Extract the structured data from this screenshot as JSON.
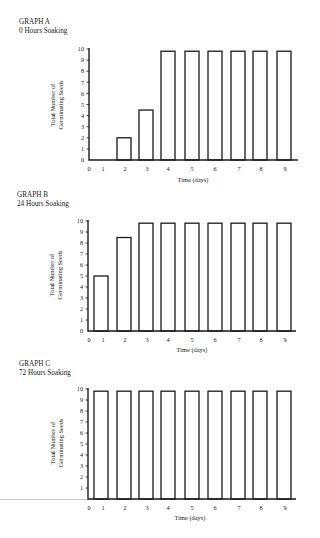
{
  "chart_data": [
    {
      "type": "bar",
      "title": "GRAPH A",
      "subtitle": "0 Hours Soaking",
      "xlabel": "Time (days)",
      "ylabel_lines": [
        "Total Number of",
        "Germinating Seeds"
      ],
      "ylabel": "Total Number of Germinating Seeds",
      "categories": [
        "1",
        "2",
        "3",
        "4",
        "5",
        "6",
        "7",
        "8",
        "9"
      ],
      "values": [
        0,
        2,
        4.5,
        9.8,
        9.8,
        9.8,
        9.8,
        9.8,
        9.8
      ],
      "x_ticks": [
        "0",
        "1",
        "2",
        "3",
        "4",
        "5",
        "6",
        "7",
        "8",
        "9"
      ],
      "y_ticks": [
        "0",
        "1",
        "2",
        "3",
        "4",
        "5",
        "6",
        "7",
        "8",
        "9",
        "10"
      ],
      "ylim": [
        0,
        10
      ],
      "grid": false,
      "legend": null
    },
    {
      "type": "bar",
      "title": "GRAPH B",
      "subtitle": "24 Hours Soaking",
      "xlabel": "Time (days)",
      "ylabel_lines": [
        "Total Number of",
        "Germinating Seeds"
      ],
      "ylabel": "Total Number of Germinating Seeds",
      "categories": [
        "1",
        "2",
        "3",
        "4",
        "5",
        "6",
        "7",
        "8",
        "9"
      ],
      "values": [
        5,
        8.5,
        9.8,
        9.8,
        9.8,
        9.8,
        9.8,
        9.8,
        9.8
      ],
      "x_ticks": [
        "0",
        "1",
        "2",
        "3",
        "4",
        "5",
        "6",
        "7",
        "8",
        "9"
      ],
      "y_ticks": [
        "0",
        "1",
        "2",
        "3",
        "4",
        "5",
        "6",
        "7",
        "8",
        "9",
        "10"
      ],
      "ylim": [
        0,
        10
      ],
      "grid": false,
      "legend": null
    },
    {
      "type": "bar",
      "title": "GRAPH C",
      "subtitle": "72 Hours Soaking",
      "xlabel": "Time (days)",
      "ylabel_lines": [
        "Total Number of",
        "Germinating Seeds"
      ],
      "ylabel": "Total Number of Germinating Seeds",
      "categories": [
        "1",
        "2",
        "3",
        "4",
        "5",
        "6",
        "7",
        "8",
        "9"
      ],
      "values": [
        9.8,
        9.8,
        9.8,
        9.8,
        9.8,
        9.8,
        9.8,
        9.8,
        9.8
      ],
      "x_ticks": [
        "0",
        "1",
        "2",
        "3",
        "4",
        "5",
        "6",
        "7",
        "8",
        "9"
      ],
      "y_ticks": [
        "",
        "1",
        "2",
        "3",
        "4",
        "5",
        "6",
        "7",
        "8",
        "9",
        "10"
      ],
      "ylim": [
        0,
        10
      ],
      "grid": false,
      "legend": null
    }
  ],
  "colors": {
    "ink": "#1a1a1a",
    "bar_fill": "#ffffff",
    "background": "#ffffff"
  }
}
